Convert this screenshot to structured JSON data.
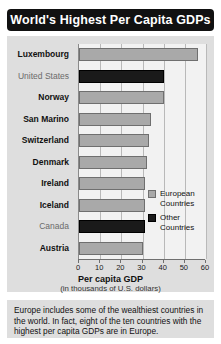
{
  "title": "World's Highest Per Capita GDPs",
  "legend": {
    "items": [
      {
        "label": "European Countries",
        "swatch": "europe",
        "color": "#a9a9a9"
      },
      {
        "label": "Other Countries",
        "swatch": "other",
        "color": "#1a1a1a"
      }
    ]
  },
  "footer": {
    "text": "Europe includes some of the wealthiest countries in the world. In fact, eight of the ten countries with the highest per capita GDPs are in Europe."
  },
  "chart_data": {
    "type": "bar",
    "orientation": "horizontal",
    "title": "World's Highest Per Capita GDPs",
    "xlabel": "Per capita GDP",
    "xlabel_sub": "(in thousands of U.S. dollars)",
    "ylabel": "",
    "xlim": [
      0,
      60
    ],
    "xticks": [
      0,
      10,
      20,
      30,
      40,
      50,
      60
    ],
    "xtick_labels": [
      "0",
      "10",
      "20",
      "30",
      "40",
      "50",
      "60"
    ],
    "grid": true,
    "legend_position": "inside-right",
    "categories": [
      "Luxembourg",
      "United States",
      "Norway",
      "San Marino",
      "Switzerland",
      "Denmark",
      "Ireland",
      "Iceland",
      "Canada",
      "Austria"
    ],
    "values": [
      56,
      40,
      40,
      34,
      33,
      32,
      31,
      31,
      31,
      30
    ],
    "groups": [
      "europe",
      "other",
      "europe",
      "europe",
      "europe",
      "europe",
      "europe",
      "europe",
      "other",
      "europe"
    ],
    "series": [
      {
        "name": "European Countries",
        "color": "#a9a9a9",
        "values": [
          56,
          null,
          40,
          34,
          33,
          32,
          31,
          31,
          null,
          30
        ]
      },
      {
        "name": "Other Countries",
        "color": "#1a1a1a",
        "values": [
          null,
          40,
          null,
          null,
          null,
          null,
          null,
          null,
          31,
          null
        ]
      }
    ]
  }
}
